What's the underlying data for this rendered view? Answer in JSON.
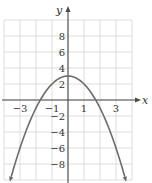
{
  "chart_data": {
    "type": "line",
    "title": "",
    "xlabel": "x",
    "ylabel": "y",
    "function": "y = 3 - x^2",
    "xlim": [
      -4,
      4
    ],
    "ylim": [
      -10,
      10
    ],
    "grid": true,
    "x_ticks": [
      -3,
      -1,
      1,
      3
    ],
    "x_tick_labels": [
      "−3",
      "−1",
      "1",
      "3"
    ],
    "y_ticks": [
      8,
      6,
      4,
      2,
      -2,
      -4,
      -6,
      -8
    ],
    "y_tick_labels": [
      "8",
      "6",
      "4",
      "2",
      "−2",
      "−4",
      "−6",
      "−8"
    ],
    "series": [
      {
        "name": "parabola",
        "x": [
          -3.6,
          -3,
          -2,
          -1.7,
          -1,
          0,
          1,
          1.7,
          2,
          3,
          3.6
        ],
        "y": [
          -9.96,
          -6,
          -1,
          0.11,
          2,
          3,
          2,
          0.11,
          -1,
          -6,
          -9.96
        ]
      }
    ],
    "vertex": [
      0,
      3
    ],
    "arrows_at_ends": true,
    "colors": {
      "curve": "#6b6b6b",
      "axis": "#4a4a4a",
      "grid": "#d6d6d6"
    }
  }
}
